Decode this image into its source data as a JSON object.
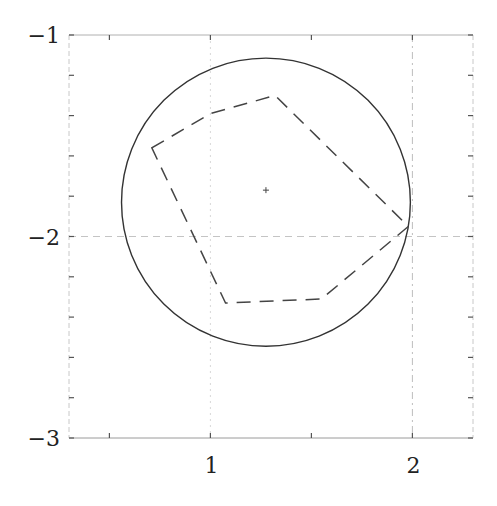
{
  "chart_data": {
    "type": "line",
    "title": "",
    "xlabel": "",
    "ylabel": "",
    "xlim": [
      0.3,
      2.3
    ],
    "ylim": [
      -3,
      -1
    ],
    "grid": false,
    "reference_lines": {
      "vertical": [
        1,
        2
      ],
      "horizontal": [
        -2
      ]
    },
    "x_ticks": {
      "major": [
        1,
        2
      ],
      "major_labels": [
        "1",
        "2"
      ],
      "minor": [
        0.5,
        1.5
      ]
    },
    "y_ticks": {
      "major": [
        -1,
        -2,
        -3
      ],
      "major_labels": [
        "−1",
        "−2",
        "−3"
      ],
      "minor": [
        -1.2,
        -1.4,
        -1.6,
        -1.8,
        -2.2,
        -2.4,
        -2.6,
        -2.8
      ]
    },
    "series": [
      {
        "name": "circle",
        "style": "solid",
        "color": "#333333",
        "shape": "circle",
        "center": [
          1.275,
          -1.83
        ],
        "radius": 0.715
      },
      {
        "name": "polygon",
        "style": "dashed",
        "color": "#444444",
        "closed": true,
        "x": [
          0.71,
          1.0,
          1.32,
          1.98,
          1.55,
          1.075
        ],
        "y": [
          -1.56,
          -1.39,
          -1.3,
          -1.95,
          -2.31,
          -2.33
        ]
      },
      {
        "name": "center-marker",
        "style": "marker",
        "marker": "+",
        "color": "#444444",
        "x": [
          1.275
        ],
        "y": [
          -1.77
        ]
      }
    ],
    "legend": null
  }
}
